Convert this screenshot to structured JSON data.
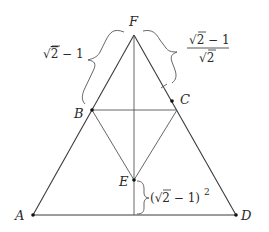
{
  "diagram": {
    "type": "geometry",
    "points": {
      "A": {
        "label": "A",
        "x": 33,
        "y": 215
      },
      "D": {
        "label": "D",
        "x": 236,
        "y": 215
      },
      "F": {
        "label": "F",
        "x": 134,
        "y": 35
      },
      "B": {
        "label": "B",
        "x": 92,
        "y": 110
      },
      "C": {
        "label": "C",
        "x": 172,
        "y": 101
      },
      "E": {
        "label": "E",
        "x": 134,
        "y": 180
      }
    },
    "annotations": {
      "left_brace": {
        "sqrt": "√",
        "radicand": "2",
        "rest": " − 1"
      },
      "right_brace": {
        "numerator_sqrt": "√",
        "numerator_radicand": "2",
        "numerator_rest": " − 1",
        "denominator_sqrt": "√",
        "denominator_radicand": "2"
      },
      "bottom_brace": {
        "open": "(",
        "sqrt": "√",
        "radicand": "2",
        "rest": " − 1)",
        "exponent": "2"
      }
    },
    "colors": {
      "line": "#3a3a3a",
      "text": "#2a2a2a",
      "background": "#ffffff"
    }
  }
}
